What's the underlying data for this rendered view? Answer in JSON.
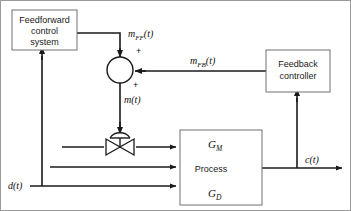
{
  "diagram": {
    "background_color": "#ffffff",
    "line_color": "#1a1a1a",
    "box_stroke_color": "#707070",
    "blocks": [
      {
        "id": "feedforward",
        "name": "feedforward-control-system-block",
        "lines": [
          "Feedforward",
          "control",
          "system"
        ],
        "x": 12,
        "y": 10,
        "w": 65,
        "h": 40
      },
      {
        "id": "feedback",
        "name": "feedback-controller-block",
        "lines": [
          "Feedback",
          "controller"
        ],
        "x": 266,
        "y": 50,
        "w": 64,
        "h": 42
      },
      {
        "id": "process",
        "name": "process-block",
        "lines": [
          "Process"
        ],
        "x": 180,
        "y": 130,
        "w": 82,
        "h": 75
      }
    ],
    "summing_junction": {
      "name": "summing-junction",
      "cx": 120,
      "cy": 70,
      "r": 13,
      "sign_top": "+",
      "sign_right": "+"
    },
    "valve": {
      "name": "control-valve-symbol",
      "cx": 120,
      "cy": 147
    },
    "signals": [
      {
        "id": "m_ff",
        "base": "m",
        "sub": "FF",
        "suffix": "(t)",
        "x": 128,
        "y": 37
      },
      {
        "id": "m",
        "base": "m",
        "sub": "",
        "suffix": "(t)",
        "x": 124,
        "y": 103
      },
      {
        "id": "m_fb",
        "base": "m",
        "sub": "FB",
        "suffix": "(t)",
        "x": 190,
        "y": 64
      },
      {
        "id": "c",
        "base": "c",
        "sub": "",
        "suffix": "(t)",
        "x": 305,
        "y": 163
      },
      {
        "id": "d",
        "base": "d",
        "sub": "",
        "suffix": "(t)",
        "x": 8,
        "y": 186
      }
    ],
    "gains": [
      {
        "id": "g_m",
        "base": "G",
        "sub": "M",
        "x": 208,
        "y": 147
      },
      {
        "id": "g_d",
        "base": "G",
        "sub": "D",
        "x": 208,
        "y": 196
      }
    ],
    "process_internal_arrows": [
      {
        "name": "gm-arrow",
        "x1": 181,
        "y1": 134,
        "x2": 252,
        "y2": 166
      },
      {
        "name": "gd-arrow",
        "x1": 181,
        "y1": 200,
        "x2": 252,
        "y2": 170
      }
    ]
  }
}
